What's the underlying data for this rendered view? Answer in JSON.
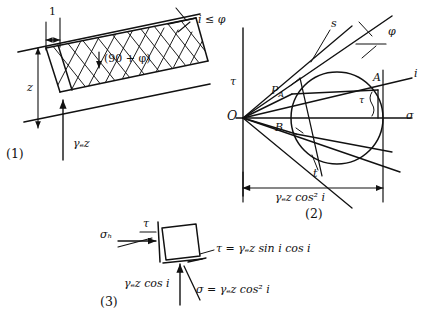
{
  "figure": {
    "domain": "engineering-diagram",
    "topic": "Infinite slope stability — stresses on a slope element and Mohr circle",
    "ink_color": "#111111",
    "background_color": "#ffffff"
  },
  "panel1": {
    "caption": "(1)",
    "labels": {
      "width_unity": "1",
      "depth": "z",
      "weight": "γₑz",
      "hatch_angle": "(90 + φ)",
      "slope_angle": "i ≤ φ"
    }
  },
  "panel2": {
    "caption": "(2)",
    "labels": {
      "origin": "O",
      "shear_axis": "τ",
      "normal_axis": "σ",
      "pole": "P",
      "pole_sub": "A",
      "point_a": "A",
      "point_b": "B",
      "strength_line": "s",
      "conjugate_line": "t",
      "friction_angle": "φ",
      "slope_line": "i",
      "shear_bracket": "τ",
      "dimension": "γₑz cos² i"
    }
  },
  "panel3": {
    "caption": "(3)",
    "labels": {
      "horizontal_stress": "σₕ",
      "shear_stress": "τ",
      "vertical_stress": "γₑz cos i",
      "shear_equation": "τ = γₑz sin i cos i",
      "normal_equation": "σ = γₑz cos² i"
    }
  }
}
